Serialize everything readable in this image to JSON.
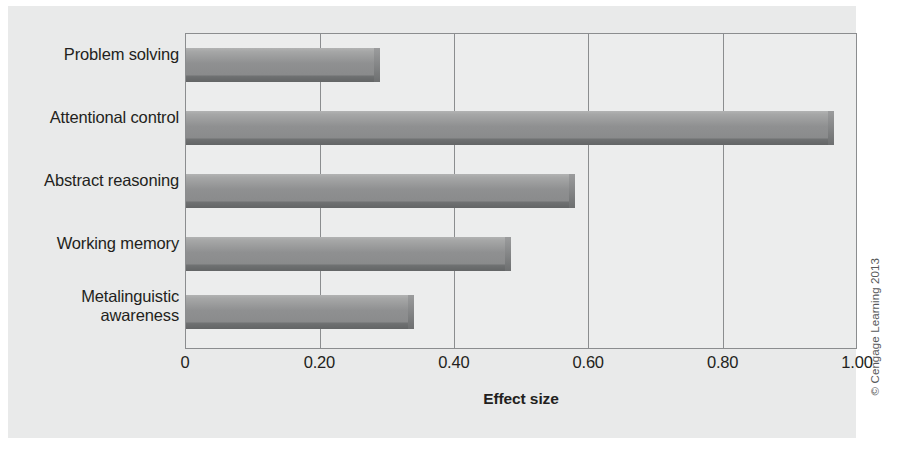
{
  "chart_data": {
    "type": "bar",
    "orientation": "horizontal",
    "title": "",
    "xlabel": "Effect size",
    "ylabel": "",
    "categories": [
      "Problem solving",
      "Attentional control",
      "Abstract reasoning",
      "Working memory",
      "Metalinguistic awareness"
    ],
    "values": [
      0.28,
      0.955,
      0.57,
      0.475,
      0.33
    ],
    "xlim": [
      0,
      1.0
    ],
    "xticks": [
      0,
      0.2,
      0.4,
      0.6,
      0.8,
      1.0
    ],
    "xtick_labels": [
      "0",
      "0.20",
      "0.40",
      "0.60",
      "0.80",
      "1.00"
    ],
    "grid": "vertical",
    "legend": "none",
    "series": [
      {
        "name": "Effect size",
        "values": [
          0.28,
          0.955,
          0.57,
          0.475,
          0.33
        ]
      }
    ]
  },
  "figure": {
    "credit": "© Cengage Learning 2013",
    "panel_color": "#e9eaea",
    "bar_color": "#8f9091",
    "axis_color": "#8b8d8f",
    "text_color": "#231f20"
  },
  "category_lines": [
    [
      "Problem solving"
    ],
    [
      "Attentional control"
    ],
    [
      "Abstract reasoning"
    ],
    [
      "Working memory"
    ],
    [
      "Metalinguistic",
      "awareness"
    ]
  ]
}
